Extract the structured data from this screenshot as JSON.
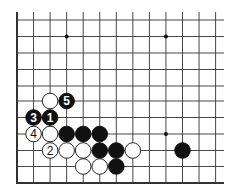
{
  "diagram": {
    "type": "go-board-fragment",
    "edges": [
      "left",
      "bottom"
    ],
    "columns": 13,
    "rows": 11,
    "star_points": [
      [
        3,
        1
      ],
      [
        9,
        1
      ],
      [
        9,
        7
      ]
    ],
    "stones": [
      {
        "col": 2,
        "row": 5,
        "color": "white",
        "label": ""
      },
      {
        "col": 3,
        "row": 5,
        "color": "black",
        "label": "5"
      },
      {
        "col": 1,
        "row": 6,
        "color": "black",
        "label": "3"
      },
      {
        "col": 2,
        "row": 6,
        "color": "black",
        "label": "1"
      },
      {
        "col": 1,
        "row": 7,
        "color": "white",
        "label": "4"
      },
      {
        "col": 2,
        "row": 7,
        "color": "white",
        "label": ""
      },
      {
        "col": 3,
        "row": 7,
        "color": "black",
        "label": ""
      },
      {
        "col": 4,
        "row": 7,
        "color": "black",
        "label": ""
      },
      {
        "col": 5,
        "row": 7,
        "color": "black",
        "label": ""
      },
      {
        "col": 2,
        "row": 8,
        "color": "white",
        "label": "2"
      },
      {
        "col": 3,
        "row": 8,
        "color": "white",
        "label": ""
      },
      {
        "col": 4,
        "row": 8,
        "color": "white",
        "label": ""
      },
      {
        "col": 5,
        "row": 8,
        "color": "black",
        "label": ""
      },
      {
        "col": 6,
        "row": 8,
        "color": "black",
        "label": ""
      },
      {
        "col": 7,
        "row": 8,
        "color": "white",
        "label": ""
      },
      {
        "col": 10,
        "row": 8,
        "color": "black",
        "label": ""
      },
      {
        "col": 4,
        "row": 9,
        "color": "white",
        "label": ""
      },
      {
        "col": 5,
        "row": 9,
        "color": "white",
        "label": ""
      },
      {
        "col": 6,
        "row": 9,
        "color": "black",
        "label": ""
      }
    ],
    "colors": {
      "line": "#333333",
      "black_stone": "#111111",
      "white_stone": "#ffffff"
    }
  }
}
